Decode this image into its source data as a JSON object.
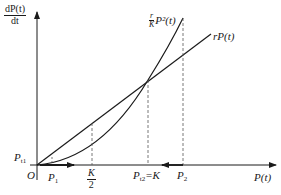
{
  "diagram": {
    "y_axis_label": {
      "num": "dP(t)",
      "den": "dt"
    },
    "x_axis_label": "P(t)",
    "origin_label": "O",
    "curves": [
      {
        "name": "quadratic",
        "label_frac_num": "r",
        "label_frac_den": "K",
        "label_rest": "P²(t)"
      },
      {
        "name": "linear",
        "label": "rP(t)"
      }
    ],
    "points": {
      "p_t1": "P",
      "p_t1_sub": "t1",
      "p1": "P",
      "p1_sub": "1",
      "k_half_num": "K",
      "k_half_den": "2",
      "p_t2": "P",
      "p_t2_sub": "t2",
      "p_t2_eq": "=K",
      "p2": "P",
      "p2_sub": "2"
    },
    "colors": {
      "line": "#1a1a1a",
      "dashed": "#555555"
    }
  }
}
